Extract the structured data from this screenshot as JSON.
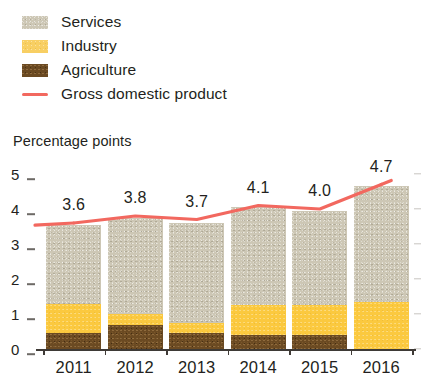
{
  "legend": {
    "items": [
      {
        "label": "Services",
        "key": "services",
        "color": "#cdc7b5",
        "type": "swatch"
      },
      {
        "label": "Industry",
        "key": "industry",
        "color": "#fbc93f",
        "type": "swatch"
      },
      {
        "label": "Agriculture",
        "key": "agriculture",
        "color": "#6b4a22",
        "type": "swatch"
      },
      {
        "label": "Gross domestic product",
        "key": "gdp",
        "color": "#f2685f",
        "type": "line"
      }
    ]
  },
  "axis_title": "Percentage points",
  "yticks": [
    "5",
    "4",
    "3",
    "2",
    "1",
    "0"
  ],
  "chart_data": {
    "type": "bar",
    "title": "",
    "subtitle": "",
    "xlabel": "",
    "ylabel": "Percentage points",
    "ylim": [
      0,
      5
    ],
    "yticks": [
      0,
      1,
      2,
      3,
      4,
      5
    ],
    "grid": false,
    "legend_position": "top-left",
    "stacked": true,
    "categories": [
      "2011",
      "2012",
      "2013",
      "2014",
      "2015",
      "2016"
    ],
    "series": [
      {
        "name": "Agriculture",
        "color": "#6b4a22",
        "values": [
          0.45,
          0.7,
          0.45,
          0.4,
          0.4,
          0.0
        ]
      },
      {
        "name": "Industry",
        "color": "#fbc93f",
        "values": [
          0.85,
          0.3,
          0.3,
          0.85,
          0.85,
          1.35
        ]
      },
      {
        "name": "Services",
        "color": "#cdc7b5",
        "values": [
          2.25,
          2.75,
          2.85,
          2.8,
          2.7,
          3.3
        ]
      }
    ],
    "overlay_line": {
      "name": "Gross domestic product",
      "color": "#f2685f",
      "values": [
        3.6,
        3.8,
        3.7,
        4.1,
        4.0,
        4.7
      ],
      "labels": [
        "3.6",
        "3.8",
        "3.7",
        "4.1",
        "4.0",
        "4.7"
      ]
    }
  }
}
